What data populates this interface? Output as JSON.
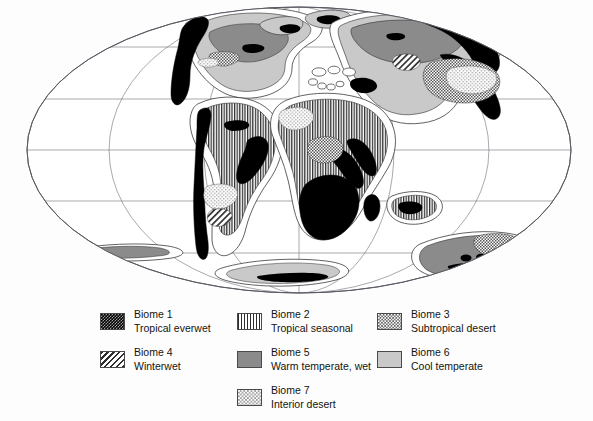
{
  "map": {
    "title": "",
    "projection": "mollweide-elliptical",
    "graticule": {
      "latitude_lines": 5,
      "meridian_lines": 5,
      "line_color": "#6e6e78"
    },
    "outline_color": "#5a5a63",
    "ocean_color": "#ffffff",
    "shelf_outline_color": "#3a3a3a"
  },
  "legend": {
    "columns": [
      {
        "items": [
          {
            "swatch": "biome-1-swatch",
            "pattern": "dense-cross-hatch-black",
            "line1": "Biome 1",
            "line2": "Tropical everwet"
          },
          {
            "swatch": "biome-4-swatch",
            "pattern": "diagonal-hatch",
            "line1": "Biome 4",
            "line2": "Winterwet"
          }
        ]
      },
      {
        "items": [
          {
            "swatch": "biome-2-swatch",
            "pattern": "vertical-stripes",
            "line1": "Biome 2",
            "line2": "Tropical seasonal"
          },
          {
            "swatch": "biome-5-swatch",
            "pattern": "solid-medium-gray",
            "line1": "Biome 5",
            "line2": "Warm temperate, wet"
          },
          {
            "swatch": "biome-7-swatch",
            "pattern": "sparse-stipple",
            "line1": "Biome 7",
            "line2": "Interior desert"
          }
        ]
      },
      {
        "items": [
          {
            "swatch": "biome-3-swatch",
            "pattern": "fine-checker-stipple",
            "line1": "Biome 3",
            "line2": "Subtropical desert"
          },
          {
            "swatch": "biome-6-swatch",
            "pattern": "solid-light-gray",
            "line1": "Biome 6",
            "line2": "Cool temperate"
          }
        ]
      }
    ]
  },
  "colors": {
    "biome_1": "#000000",
    "biome_2": "#2c2c2c",
    "biome_3": "#555555",
    "biome_4": "#2f2f2f",
    "biome_5": "#8b8b8b",
    "biome_6": "#c9c9c9",
    "biome_7": "#9a9a9a",
    "background": "#ffffff"
  }
}
